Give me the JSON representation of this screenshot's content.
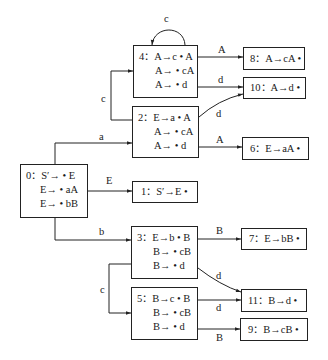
{
  "diagram": {
    "type": "LR(0) item set DFA",
    "states": [
      {
        "id": "0",
        "label": "0：",
        "items": [
          "S′→ • E",
          "E→ • aA",
          "E→ • bB"
        ]
      },
      {
        "id": "1",
        "label": "1：",
        "items": [
          "S′→E •"
        ]
      },
      {
        "id": "2",
        "label": "2：",
        "items": [
          "E→a • A",
          "A→ • cA",
          "A→ • d"
        ]
      },
      {
        "id": "3",
        "label": "3：",
        "items": [
          "E→b • B",
          "B→ • cB",
          "B→ • d"
        ]
      },
      {
        "id": "4",
        "label": "4：",
        "items": [
          "A→c • A",
          "A→ • cA",
          "A→ • d"
        ]
      },
      {
        "id": "5",
        "label": "5：",
        "items": [
          "B→c • B",
          "B→ • cB",
          "B→ • d"
        ]
      },
      {
        "id": "6",
        "label": "6：",
        "items": [
          "E→aA •"
        ]
      },
      {
        "id": "7",
        "label": "7：",
        "items": [
          "E→bB •"
        ]
      },
      {
        "id": "8",
        "label": "8：",
        "items": [
          "A→cA •"
        ]
      },
      {
        "id": "9",
        "label": "9：",
        "items": [
          "B→cB •"
        ]
      },
      {
        "id": "10",
        "label": "10：",
        "items": [
          "A→d •"
        ]
      },
      {
        "id": "11",
        "label": "11：",
        "items": [
          "B→d •"
        ]
      }
    ],
    "transitions": [
      {
        "from": "0",
        "to": "1",
        "symbol": "E"
      },
      {
        "from": "0",
        "to": "2",
        "symbol": "a"
      },
      {
        "from": "0",
        "to": "3",
        "symbol": "b"
      },
      {
        "from": "2",
        "to": "4",
        "symbol": "c"
      },
      {
        "from": "2",
        "to": "10",
        "symbol": "d"
      },
      {
        "from": "2",
        "to": "6",
        "symbol": "A"
      },
      {
        "from": "4",
        "to": "4",
        "symbol": "c"
      },
      {
        "from": "4",
        "to": "8",
        "symbol": "A"
      },
      {
        "from": "4",
        "to": "10",
        "symbol": "d"
      },
      {
        "from": "3",
        "to": "7",
        "symbol": "B"
      },
      {
        "from": "3",
        "to": "5",
        "symbol": "c"
      },
      {
        "from": "3",
        "to": "11",
        "symbol": "d"
      },
      {
        "from": "5",
        "to": "11",
        "symbol": "d"
      },
      {
        "from": "5",
        "to": "9",
        "symbol": "B"
      }
    ]
  }
}
